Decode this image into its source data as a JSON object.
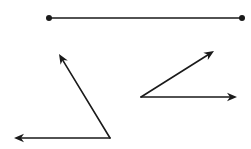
{
  "diagram": {
    "description": "Geometry figure: a line segment and two angles formed by rays",
    "stroke_color": "#1a1a1a",
    "background_color": "#ffffff",
    "segment": {
      "label": "line segment",
      "start": [
        49,
        18
      ],
      "end": [
        242,
        18
      ]
    },
    "angles": [
      {
        "label": "angle 1",
        "vertex": [
          110,
          138
        ],
        "rays": [
          {
            "label": "ray toward upper-left",
            "tip": [
              59,
              54
            ]
          },
          {
            "label": "ray toward left",
            "tip": [
              14,
              138
            ]
          }
        ]
      },
      {
        "label": "angle 2",
        "vertex": [
          141,
          97
        ],
        "rays": [
          {
            "label": "ray toward upper-right",
            "tip": [
              214,
              51
            ]
          },
          {
            "label": "ray toward right",
            "tip": [
              237,
              97
            ]
          }
        ]
      }
    ]
  }
}
